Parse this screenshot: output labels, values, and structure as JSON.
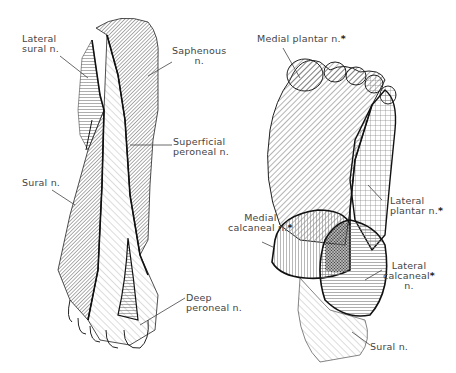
{
  "figure": {
    "views": [
      {
        "id": "dorsal",
        "label": "Dorsal view"
      },
      {
        "id": "plantar",
        "label": "Plantar view"
      }
    ]
  },
  "dorsal_labels": {
    "lateral_sural": {
      "line1": "Lateral",
      "line2": "sural n."
    },
    "saphenous": {
      "line1": "Saphenous",
      "line2": "n."
    },
    "superficial_peroneal": {
      "line1": "Superficial",
      "line2": "peroneal n."
    },
    "sural": {
      "line1": "Sural n."
    },
    "deep_peroneal": {
      "line1": "Deep",
      "line2": "peroneal n."
    }
  },
  "plantar_labels": {
    "medial_plantar": {
      "line1": "Medial plantar n.",
      "star": "*"
    },
    "lateral_plantar": {
      "line1": "Lateral",
      "line2": "plantar n.",
      "star": "*"
    },
    "medial_calcaneal": {
      "line1": "Medial",
      "line2": "calcaneal n.",
      "star": "*"
    },
    "lateral_calcaneal": {
      "line1": "Lateral",
      "line2": "calcaneal",
      "line3": "n.",
      "star": "*"
    },
    "sural": {
      "line1": "Sural n."
    }
  },
  "colors": {
    "outline": "#1a1a1a",
    "hatch": "#555555",
    "leader": "#444444",
    "background": "#ffffff"
  }
}
